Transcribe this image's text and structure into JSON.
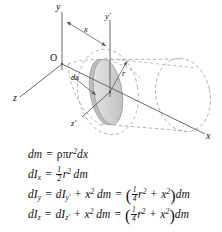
{
  "figure": {
    "background_color": "#ffffff",
    "ink_color": "#111111"
  },
  "diagram": {
    "name": "cylinder-with-disk-element",
    "labels": {
      "y_axis": "y",
      "y_prime_axis": "y′",
      "z_axis": "z",
      "z_prime_axis": "z′",
      "x_axis": "x",
      "origin": "O",
      "distance_x": "x",
      "thickness_dx": "dx",
      "radius_r": "r"
    },
    "colors": {
      "line": "#5a5a5a",
      "dashed_line": "#8a8a8a",
      "disk_fill": "#d9d9d9",
      "disk_rim": "#a8a8a8",
      "cylinder_outline": "#7d7d7d"
    }
  },
  "equations": [
    {
      "id": "eq-dm",
      "name": "equation-mass-element",
      "text": "dm = ρπr² dx"
    },
    {
      "id": "eq-dIx",
      "name": "equation-dIx",
      "text": "dIₓ = ½ r² dm"
    },
    {
      "id": "eq-dIy",
      "name": "equation-dIy",
      "text": "dIᵧ = dIᵧ′ + x² dm = (¼r² + x²)dm"
    },
    {
      "id": "eq-dIz",
      "name": "equation-dIz",
      "text": "dI₂ = dI₂′ + x² dm = (¼r² + x²)dm"
    }
  ],
  "equation_parts": {
    "dm": {
      "lhs": "dm",
      "eq": "=",
      "rho": "ρ",
      "pi": "π",
      "r": "r",
      "r_exp": "2",
      "dx": "dx"
    },
    "dIx": {
      "lhs_d": "dI",
      "lhs_sub": "x",
      "eq": "=",
      "num": "1",
      "den": "2",
      "r": "r",
      "r_exp": "2",
      "dm": "dm"
    },
    "dIy": {
      "lhs_d": "dI",
      "lhs_sub": "y",
      "eq1": "=",
      "rhs_d": "dI",
      "rhs_sub": "y′",
      "plus1": "+",
      "x": "x",
      "x_exp": "2",
      "dm1": "dm",
      "eq2": "=",
      "open": "(",
      "num": "1",
      "den": "4",
      "r": "r",
      "r_exp": "2",
      "plus2": "+",
      "x2": "x",
      "x2_exp": "2",
      "close": ")",
      "dm2": "dm"
    },
    "dIz": {
      "lhs_d": "dI",
      "lhs_sub": "z",
      "eq1": "=",
      "rhs_d": "dI",
      "rhs_sub": "z′",
      "plus1": "+",
      "x": "x",
      "x_exp": "2",
      "dm1": "dm",
      "eq2": "=",
      "open": "(",
      "num": "1",
      "den": "4",
      "r": "r",
      "r_exp": "2",
      "plus2": "+",
      "x2": "x",
      "x2_exp": "2",
      "close": ")",
      "dm2": "dm"
    }
  }
}
